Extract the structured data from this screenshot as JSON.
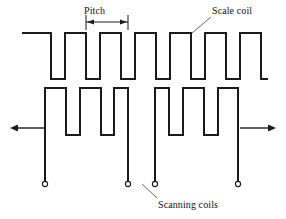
{
  "figure": {
    "type": "technical-diagram",
    "background_color": "#ffffff",
    "line_color": "#1a1a1a",
    "leader_color": "#555555",
    "width": 286,
    "height": 219
  },
  "labels": {
    "pitch": "Pitch",
    "scale_coil": "Scale coil",
    "scanning_coils": "Scanning coils"
  },
  "dimension": {
    "name": "Pitch",
    "start_x": 86,
    "end_x": 128,
    "y": 22,
    "extension_top_y": 15,
    "extension_bottom_y": 30
  },
  "leaders": {
    "scale_coil": {
      "x1": 211,
      "y1": 17,
      "x2": 192,
      "y2": 33
    },
    "scanning_coils": {
      "x1": 157,
      "y1": 198,
      "x2": 142,
      "y2": 184
    }
  },
  "scale_coil": {
    "name": "scale-coil",
    "top_y": 33,
    "bottom_y": 79,
    "start_x": 22,
    "end_x": 268,
    "pulse_count": 6,
    "lead_in_x": 51,
    "lead_out_x": 240,
    "path": "M22,33 L51,33 L51,79 L65,79 L65,33 L86,33 L86,79 L100,79 L100,33 L121,33 L121,79 L135,79 L135,33 L156,33 L156,79 L170,79 L170,33 L191,33 L191,79 L205,79 L205,33 L226,33 L226,79 L240,79 L240,33 L261,33 L261,79 L268,79"
  },
  "scanning_coils": {
    "name": "scanning-coils",
    "top_y": 88,
    "bottom_y": 135,
    "terminal_y": 184,
    "group_count": 2,
    "groups": [
      {
        "name": "scanning-coil-left",
        "pulse_count": 3,
        "path": "M45,184 L45,88 L66,88 L66,135 L80,135 L80,88 L101,88 L101,135 L114,135 L114,88 L128,88 L128,184"
      },
      {
        "name": "scanning-coil-right",
        "pulse_count": 3,
        "path": "M155,184 L155,88 L169,88 L169,135 L183,135 L183,88 L204,88 L204,135 L218,135 L218,88 L238,88 L238,184"
      }
    ],
    "terminals": [
      {
        "name": "terminal-1",
        "x": 45,
        "y": 184,
        "r": 2.6
      },
      {
        "name": "terminal-2",
        "x": 128,
        "y": 184,
        "r": 2.6
      },
      {
        "name": "terminal-3",
        "x": 155,
        "y": 184,
        "r": 2.6
      },
      {
        "name": "terminal-4",
        "x": 238,
        "y": 184,
        "r": 2.6
      }
    ]
  },
  "motion_arrows": [
    {
      "name": "motion-arrow-left",
      "direction": "left",
      "y": 128,
      "tail_x": 44,
      "head_x": 10,
      "head_points": "10,128 18,124.4 18,131.6"
    },
    {
      "name": "motion-arrow-right",
      "direction": "right",
      "y": 128,
      "tail_x": 240,
      "head_x": 276,
      "head_points": "276,128 268,124.4 268,131.6"
    }
  ]
}
